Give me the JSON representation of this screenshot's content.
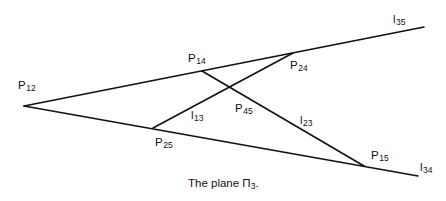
{
  "diagram": {
    "caption": {
      "text": "The plane ",
      "symbol": "Π",
      "subscript": "3",
      "suffix": "."
    },
    "points": [
      {
        "id": "P12",
        "base": "P",
        "sub": "12",
        "x": 24,
        "y": 106,
        "label_x": 18,
        "label_y": 80
      },
      {
        "id": "P14",
        "base": "P",
        "sub": "14",
        "x": 202,
        "y": 71,
        "label_x": 188,
        "label_y": 53
      },
      {
        "id": "P24",
        "base": "P",
        "sub": "24",
        "x": 293,
        "y": 53,
        "label_x": 290,
        "label_y": 60
      },
      {
        "id": "P45",
        "base": "P",
        "sub": "45",
        "x": 230,
        "y": 88,
        "label_x": 235,
        "label_y": 103
      },
      {
        "id": "P25",
        "base": "P",
        "sub": "25",
        "x": 153,
        "y": 128,
        "label_x": 155,
        "label_y": 137
      },
      {
        "id": "P15",
        "base": "P",
        "sub": "15",
        "x": 364,
        "y": 166,
        "label_x": 371,
        "label_y": 150
      }
    ],
    "lines": [
      {
        "id": "l35",
        "base": "l",
        "sub": "35",
        "from": [
          24,
          106
        ],
        "to": [
          424,
          27
        ],
        "label_x": 393,
        "label_y": 14
      },
      {
        "id": "l34",
        "base": "l",
        "sub": "34",
        "from": [
          24,
          106
        ],
        "to": [
          418,
          176
        ],
        "label_x": 420,
        "label_y": 162
      },
      {
        "id": "l13",
        "base": "l",
        "sub": "13",
        "from": [
          153,
          128
        ],
        "to": [
          293,
          53
        ],
        "label_x": 191,
        "label_y": 110
      },
      {
        "id": "l23",
        "base": "l",
        "sub": "23",
        "from": [
          202,
          71
        ],
        "to": [
          364,
          166
        ],
        "label_x": 300,
        "label_y": 115
      }
    ],
    "stroke_color": "#111111",
    "text_color": "#111111"
  }
}
